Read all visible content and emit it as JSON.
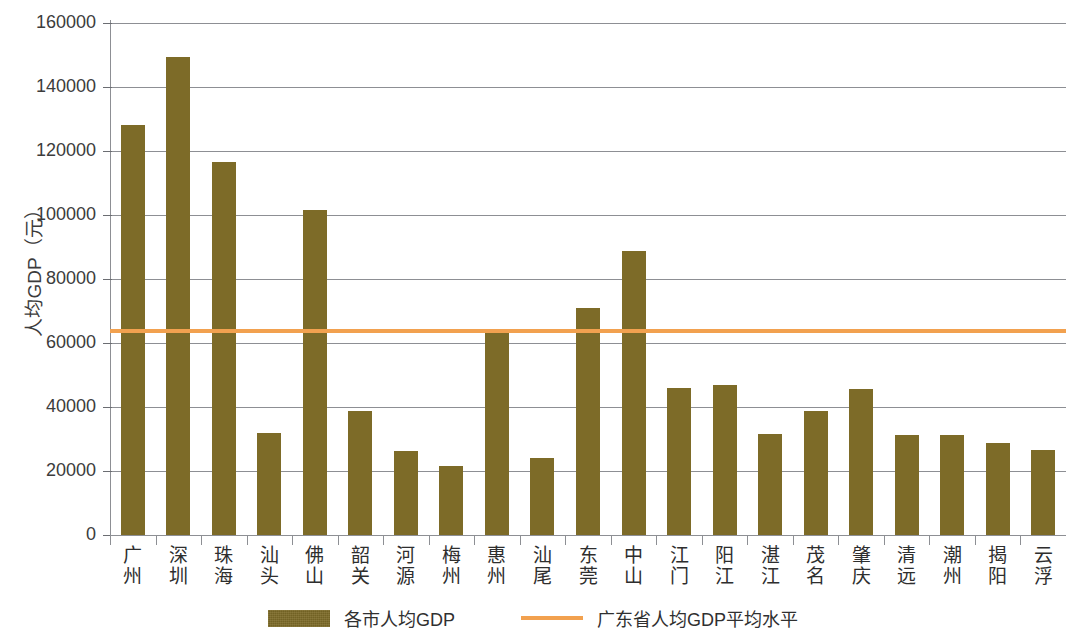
{
  "chart_data": {
    "type": "bar",
    "title": "",
    "xlabel": "",
    "ylabel": "人均GDP（元）",
    "ylim": [
      0,
      160000
    ],
    "ytick_values": [
      0,
      20000,
      40000,
      60000,
      80000,
      100000,
      120000,
      140000,
      160000
    ],
    "ytick_labels": [
      "0",
      "20000",
      "40000",
      "60000",
      "80000",
      "100000",
      "120000",
      "140000",
      "160000"
    ],
    "grid": true,
    "legend_position": "bottom",
    "categories": [
      "广州",
      "深圳",
      "珠海",
      "汕头",
      "佛山",
      "韶关",
      "河源",
      "梅州",
      "惠州",
      "汕尾",
      "东莞",
      "中山",
      "江门",
      "阳江",
      "湛江",
      "茂名",
      "肇庆",
      "清远",
      "潮州",
      "揭阳",
      "云浮"
    ],
    "series": [
      {
        "name": "各市人均GDP",
        "type": "bar",
        "color": "#7d6b28",
        "values": [
          128000,
          149500,
          116500,
          32000,
          101500,
          38700,
          26200,
          21500,
          63000,
          24000,
          70800,
          88700,
          45800,
          47000,
          31500,
          38800,
          45500,
          31200,
          31100,
          28800,
          26500
        ]
      },
      {
        "name": "广东省人均GDP平均水平",
        "type": "line",
        "color": "#f2a14f",
        "constant_value": 63800
      }
    ],
    "legend": [
      "各市人均GDP",
      "广东省人均GDP平均水平"
    ]
  },
  "legend": {
    "bar_label": "各市人均GDP",
    "line_label": "广东省人均GDP平均水平"
  }
}
